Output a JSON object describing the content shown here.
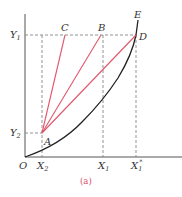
{
  "figure": {
    "caption": "(a)",
    "colors": {
      "axis": "#555555",
      "curve": "#222222",
      "red_lines": "#e0566b",
      "dashed": "#777777",
      "caption": "#d94c66"
    },
    "axes": {
      "origin_label": "O",
      "y_ticks": [
        {
          "main": "Y",
          "sub": "1"
        },
        {
          "main": "Y",
          "sub": "2"
        }
      ],
      "x_ticks": [
        {
          "main": "X",
          "sub": "2"
        },
        {
          "main": "X",
          "sub": "1"
        },
        {
          "main": "X",
          "sub": "1",
          "sup": "*"
        }
      ]
    },
    "points": {
      "A": "A",
      "B": "B",
      "C": "C",
      "D": "D",
      "E": "E"
    }
  }
}
